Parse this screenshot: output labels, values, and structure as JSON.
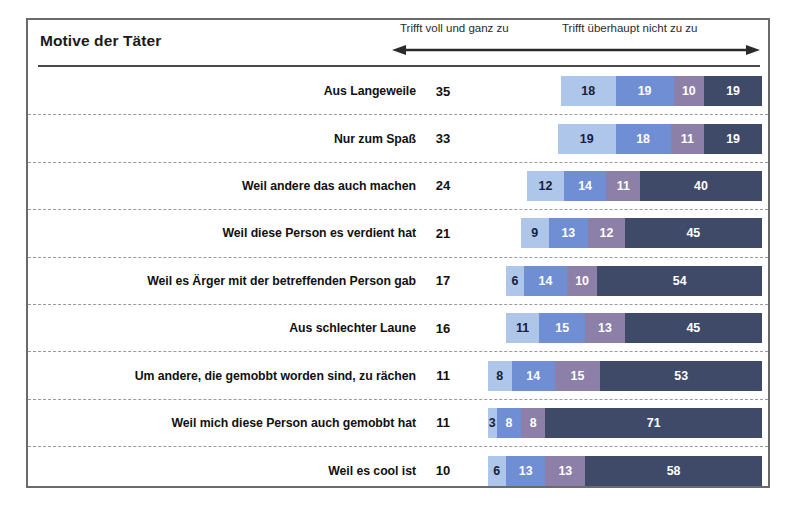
{
  "header": {
    "title": "Motive der Täter",
    "scale_left": "Trifft voll und ganz zu",
    "scale_right": "Trifft überhaupt nicht zu  zu",
    "arrow_icon": "double-headed-arrow-icon"
  },
  "colors": {
    "segment_1": "#ffffff",
    "segment_2": "#aec6ea",
    "segment_3": "#6f8ed4",
    "segment_4": "#8c7fa8",
    "segment_5": "#3e4a68",
    "frame": "#6b6b6b",
    "rule": "#4a4a4a",
    "row_divider": "#9a9a9a",
    "text": "#111111"
  },
  "chart_data": {
    "type": "bar",
    "title": "Motive der Täter",
    "subtype": "100% stacked horizontal bar",
    "xlabel": "",
    "ylabel": "",
    "xlim": [
      0,
      101
    ],
    "grid": false,
    "legend_position": "top",
    "annotations": [
      "Trifft voll und ganz zu",
      "Trifft überhaupt nicht zu  zu"
    ],
    "series": [
      {
        "name": "Trifft voll und ganz zu",
        "color": "#ffffff",
        "values": [
          35,
          33,
          24,
          21,
          17,
          16,
          11,
          11,
          10
        ]
      },
      {
        "name": "2",
        "color": "#aec6ea",
        "values": [
          18,
          19,
          12,
          9,
          6,
          11,
          8,
          3,
          6
        ]
      },
      {
        "name": "3",
        "color": "#6f8ed4",
        "values": [
          19,
          18,
          14,
          13,
          14,
          15,
          14,
          8,
          13
        ]
      },
      {
        "name": "4",
        "color": "#8c7fa8",
        "values": [
          10,
          11,
          11,
          12,
          10,
          13,
          15,
          8,
          13
        ]
      },
      {
        "name": "Trifft überhaupt nicht zu",
        "color": "#3e4a68",
        "values": [
          19,
          19,
          40,
          45,
          54,
          45,
          53,
          71,
          58
        ]
      }
    ],
    "categories": [
      "Aus Langeweile",
      "Nur zum Spaß",
      "Weil andere das auch machen",
      "Weil diese Person es verdient hat",
      "Weil es Ärger mit der betreffenden Person gab",
      "Aus schlechter Laune",
      "Um andere, die gemobbt worden sind, zu rächen",
      "Weil mich diese Person auch gemobbt hat",
      "Weil es cool ist"
    ]
  },
  "rows": [
    {
      "label": "Aus Langeweile",
      "first": 35,
      "segments": [
        18,
        19,
        10,
        19
      ]
    },
    {
      "label": "Nur zum Spaß",
      "first": 33,
      "segments": [
        19,
        18,
        11,
        19
      ]
    },
    {
      "label": "Weil andere das auch machen",
      "first": 24,
      "segments": [
        12,
        14,
        11,
        40
      ]
    },
    {
      "label": "Weil diese Person es verdient hat",
      "first": 21,
      "segments": [
        9,
        13,
        12,
        45
      ]
    },
    {
      "label": "Weil es Ärger mit der betreffenden Person gab",
      "first": 17,
      "segments": [
        6,
        14,
        10,
        54
      ]
    },
    {
      "label": "Aus schlechter Laune",
      "first": 16,
      "segments": [
        11,
        15,
        13,
        45
      ]
    },
    {
      "label": "Um andere, die gemobbt worden sind, zu rächen",
      "first": 11,
      "segments": [
        8,
        14,
        15,
        53
      ]
    },
    {
      "label": "Weil mich diese Person auch gemobbt hat",
      "first": 11,
      "segments": [
        3,
        8,
        8,
        71
      ]
    },
    {
      "label": "Weil es cool ist",
      "first": 10,
      "segments": [
        6,
        13,
        13,
        58
      ]
    }
  ]
}
